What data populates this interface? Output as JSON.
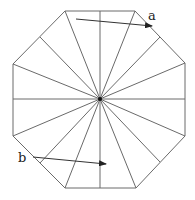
{
  "diagram": {
    "shape": "regular-octagon-with-radial-lines",
    "labels": {
      "a": "a",
      "b": "b"
    },
    "colors": {
      "line": "#6a6a6a",
      "arrow": "#333333",
      "center_dot": "#111111",
      "background": "#ffffff"
    },
    "center": [
      100,
      99
    ],
    "vertices": [
      [
        65,
        11
      ],
      [
        135,
        11
      ],
      [
        185,
        63
      ],
      [
        185,
        136
      ],
      [
        136,
        188
      ],
      [
        65,
        188
      ],
      [
        13,
        136
      ],
      [
        13,
        64
      ]
    ],
    "arrows": [
      {
        "label": "a",
        "from": [
          76,
          19
        ],
        "to": [
          152,
          26
        ]
      },
      {
        "label": "b",
        "from": [
          33,
          157
        ],
        "to": [
          106,
          164
        ]
      }
    ]
  }
}
